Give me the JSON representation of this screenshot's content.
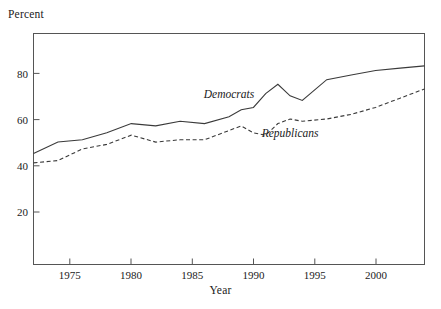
{
  "chart_data": {
    "type": "line",
    "title": "",
    "xlabel": "Year",
    "ylabel": "Percent",
    "xlim": [
      1972,
      2004
    ],
    "ylim": [
      0,
      100
    ],
    "xticks": [
      1975,
      1980,
      1985,
      1990,
      1995,
      2000
    ],
    "yticks": [
      20,
      40,
      60,
      80
    ],
    "grid": false,
    "legend_position": "inline-annotation",
    "x": [
      1972,
      1974,
      1976,
      1978,
      1980,
      1982,
      1984,
      1986,
      1988,
      1989,
      1990,
      1991,
      1992,
      1993,
      1994,
      1996,
      1998,
      2000,
      2002,
      2004
    ],
    "series": [
      {
        "name": "Democrats",
        "style": "solid",
        "color": "#3a3a3a",
        "values": [
          48,
          53,
          54,
          57,
          61,
          60,
          62,
          61,
          64,
          67,
          68,
          74,
          78,
          73,
          71,
          80,
          82,
          84,
          85,
          86
        ]
      },
      {
        "name": "Republicans",
        "style": "dashed",
        "color": "#3a3a3a",
        "values": [
          44,
          45,
          50,
          52,
          56,
          53,
          54,
          54,
          58,
          60,
          57,
          56,
          61,
          63,
          62,
          63,
          65,
          68,
          72,
          76
        ]
      }
    ],
    "annotations": [
      {
        "text": "Democrats",
        "x": 1988,
        "y": 72
      },
      {
        "text": "Republicans",
        "x": 1993,
        "y": 55
      }
    ],
    "axis_color": "#555555",
    "tick_labels_x": [
      "1975",
      "1980",
      "1985",
      "1990",
      "1995",
      "2000"
    ],
    "tick_labels_y": [
      "20",
      "40",
      "60",
      "80"
    ]
  }
}
